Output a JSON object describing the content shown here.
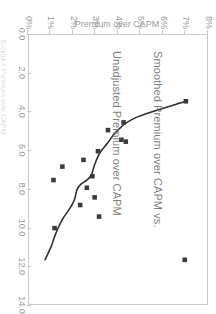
{
  "chart_data": {
    "type": "scatter",
    "title": "Smoothed Premium over CAPM vs. Unadjusted Premium over CAPM",
    "title_lines": [
      "Smoothed Premium over CAPM vs.",
      "Unadjusted Premium over CAPM"
    ],
    "xlabel": "",
    "ylabel": "Premium over CAPM",
    "xlim": [
      0.0,
      14.0
    ],
    "ylim": [
      0,
      8
    ],
    "x_ticks": [
      "0.0",
      "2.0",
      "4.0",
      "6.0",
      "8.0",
      "10.0",
      "12.0",
      "14.0"
    ],
    "x_tick_values": [
      0.0,
      2.0,
      4.0,
      6.0,
      8.0,
      10.0,
      12.0,
      14.0
    ],
    "y_ticks": [
      "0%",
      "1%",
      "2%",
      "3%",
      "4%",
      "5%",
      "6%",
      "7%",
      "8%"
    ],
    "y_tick_values": [
      0,
      1,
      2,
      3,
      4,
      5,
      6,
      7,
      8
    ],
    "grid": false,
    "legend": false,
    "marker_color": "#3a3a3a",
    "line_color": "#2e2e2e",
    "frame_color": "#c9c9c9",
    "text_color": "#9a9a9a",
    "title_color": "#808080",
    "series": [
      {
        "name": "Unadjusted Premium over CAPM",
        "type": "scatter",
        "marker": "square",
        "points": [
          {
            "x": 3.45,
            "y": 7.05
          },
          {
            "x": 4.55,
            "y": 4.25
          },
          {
            "x": 4.95,
            "y": 3.55
          },
          {
            "x": 5.55,
            "y": 4.35
          },
          {
            "x": 5.45,
            "y": 4.15
          },
          {
            "x": 6.05,
            "y": 3.1
          },
          {
            "x": 6.5,
            "y": 2.45
          },
          {
            "x": 6.85,
            "y": 1.5
          },
          {
            "x": 7.35,
            "y": 2.85
          },
          {
            "x": 7.55,
            "y": 1.1
          },
          {
            "x": 7.95,
            "y": 2.6
          },
          {
            "x": 8.45,
            "y": 2.95
          },
          {
            "x": 8.85,
            "y": 2.3
          },
          {
            "x": 9.45,
            "y": 3.15
          },
          {
            "x": 10.05,
            "y": 1.15
          },
          {
            "x": 11.7,
            "y": 7.0
          }
        ]
      },
      {
        "name": "Smoothed Premium over CAPM",
        "type": "line",
        "points": [
          {
            "x": 3.45,
            "y": 7.05
          },
          {
            "x": 4.3,
            "y": 4.8
          },
          {
            "x": 5.0,
            "y": 3.95
          },
          {
            "x": 5.6,
            "y": 3.55
          },
          {
            "x": 6.1,
            "y": 3.2
          },
          {
            "x": 6.6,
            "y": 3.0
          },
          {
            "x": 7.0,
            "y": 2.88
          },
          {
            "x": 7.3,
            "y": 2.8
          },
          {
            "x": 7.55,
            "y": 2.6
          },
          {
            "x": 7.75,
            "y": 2.35
          },
          {
            "x": 7.95,
            "y": 2.2
          },
          {
            "x": 8.2,
            "y": 2.12
          },
          {
            "x": 8.55,
            "y": 2.05
          },
          {
            "x": 9.0,
            "y": 1.85
          },
          {
            "x": 9.6,
            "y": 1.5
          },
          {
            "x": 10.4,
            "y": 1.18
          },
          {
            "x": 11.0,
            "y": 1.0
          },
          {
            "x": 11.7,
            "y": 0.72
          }
        ]
      }
    ]
  },
  "figure": {
    "caption": "Exhibit 4  Premium over CAPM"
  }
}
